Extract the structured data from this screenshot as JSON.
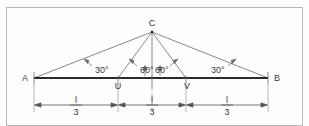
{
  "figure": {
    "border_color": "#b9b9b9",
    "background": "#fdfdfd",
    "line_color": "#555555",
    "baseline_color": "#2b2b2b",
    "text_color": "#3a3a3a",
    "points": [
      {
        "id": "A",
        "label": "A",
        "x": 34,
        "y": 78
      },
      {
        "id": "U",
        "label": "U",
        "x": 118,
        "y": 78
      },
      {
        "id": "V",
        "label": "V",
        "x": 186,
        "y": 78
      },
      {
        "id": "B",
        "label": "B",
        "x": 268,
        "y": 78
      },
      {
        "id": "C",
        "label": "C",
        "x": 152,
        "y": 30
      }
    ],
    "angles": [
      {
        "label": "30°",
        "vertex": "A",
        "x": 83,
        "y": 70
      },
      {
        "label": "60°",
        "vertex": "C",
        "x": 128,
        "y": 70
      },
      {
        "label": "60°",
        "vertex": "C",
        "x": 155,
        "y": 70
      },
      {
        "label": "30°",
        "vertex": "B",
        "x": 214,
        "y": 70
      }
    ],
    "dimensions": [
      {
        "id": "dim-left",
        "numerator": "l",
        "denominator": "3",
        "from_x": 34,
        "to_x": 118,
        "label_x": 76,
        "y": 105
      },
      {
        "id": "dim-middle",
        "numerator": "l",
        "denominator": "3",
        "from_x": 118,
        "to_x": 186,
        "label_x": 152,
        "y": 105
      },
      {
        "id": "dim-right",
        "numerator": "l",
        "denominator": "3",
        "from_x": 186,
        "to_x": 268,
        "label_x": 227,
        "y": 105
      }
    ]
  }
}
